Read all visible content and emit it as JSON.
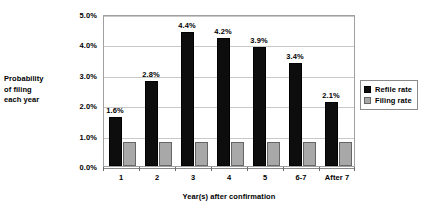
{
  "chart_data": {
    "type": "bar",
    "title": "",
    "xlabel": "Year(s) after confirmation",
    "ylabel": "Probability of filing each year",
    "ylabel_lines": [
      "Probability",
      "of filing",
      "each year"
    ],
    "categories": [
      "1",
      "2",
      "3",
      "4",
      "5",
      "6-7",
      "After 7"
    ],
    "series": [
      {
        "name": "Refile rate",
        "color": "#0d0d0d",
        "values": [
          1.6,
          2.8,
          4.4,
          4.2,
          3.9,
          3.4,
          2.1
        ],
        "labels": [
          "1.6%",
          "2.8%",
          "4.4%",
          "4.2%",
          "3.9%",
          "3.4%",
          "2.1%"
        ]
      },
      {
        "name": "Filing rate",
        "color": "#a8a8a8",
        "values": [
          0.8,
          0.8,
          0.8,
          0.8,
          0.8,
          0.8,
          0.8
        ],
        "labels": [
          "",
          "",
          "",
          "",
          "",
          "",
          ""
        ]
      }
    ],
    "ylim": [
      0,
      5
    ],
    "ytick_values": [
      0,
      1,
      2,
      3,
      4,
      5
    ],
    "ytick_labels": [
      "0.0%",
      "1.0%",
      "2.0%",
      "3.0%",
      "4.0%",
      "5.0%"
    ],
    "grid": true,
    "legend_position": "right",
    "units": "percent"
  },
  "legend": {
    "entries": [
      {
        "label": "Refile rate",
        "swatch": "black-square-swatch"
      },
      {
        "label": "Filing rate",
        "swatch": "gray-square-swatch"
      }
    ]
  }
}
